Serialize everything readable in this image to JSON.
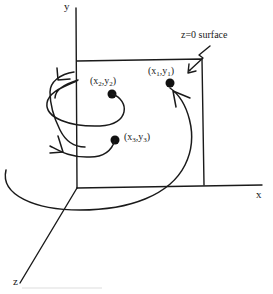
{
  "diagram": {
    "axes": {
      "x_label": "x",
      "y_label": "y",
      "z_label": "z"
    },
    "surface_label": "z=0 surface",
    "points": [
      {
        "name": "point-1",
        "var_x": "x",
        "var_y": "y",
        "index": "1"
      },
      {
        "name": "point-2",
        "var_x": "x",
        "var_y": "y",
        "index": "2"
      },
      {
        "name": "point-3",
        "var_x": "x",
        "var_y": "y",
        "index": "3"
      }
    ]
  }
}
